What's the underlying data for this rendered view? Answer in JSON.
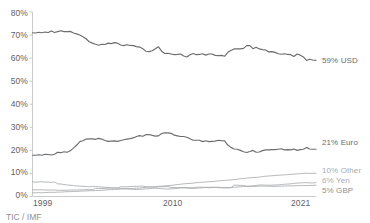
{
  "chart_data": {
    "type": "line",
    "title": "",
    "subtitle": "",
    "xlabel": "",
    "ylabel": "",
    "ylim": [
      0,
      80
    ],
    "xlim": [
      1999,
      2021.75
    ],
    "grid": false,
    "legend_position": "right-of-plot-line-end",
    "y_ticks": [
      "0%",
      "10%",
      "20%",
      "30%",
      "40%",
      "50%",
      "60%",
      "70%",
      "80%"
    ],
    "y_tick_values": [
      0,
      10,
      20,
      30,
      40,
      50,
      60,
      70,
      80
    ],
    "x_ticks": [
      "1999",
      "2010",
      "2021"
    ],
    "x_tick_values": [
      1999,
      2010,
      2021
    ],
    "x": [
      1999,
      1999.25,
      1999.5,
      1999.75,
      2000,
      2000.25,
      2000.5,
      2000.75,
      2001,
      2001.25,
      2001.5,
      2001.75,
      2002,
      2002.25,
      2002.5,
      2002.75,
      2003,
      2003.25,
      2003.5,
      2003.75,
      2004,
      2004.25,
      2004.5,
      2004.75,
      2005,
      2005.25,
      2005.5,
      2005.75,
      2006,
      2006.25,
      2006.5,
      2006.75,
      2007,
      2007.25,
      2007.5,
      2007.75,
      2008,
      2008.25,
      2008.5,
      2008.75,
      2009,
      2009.25,
      2009.5,
      2009.75,
      2010,
      2010.25,
      2010.5,
      2010.75,
      2011,
      2011.25,
      2011.5,
      2011.75,
      2012,
      2012.25,
      2012.5,
      2012.75,
      2013,
      2013.25,
      2013.5,
      2013.75,
      2014,
      2014.25,
      2014.5,
      2014.75,
      2015,
      2015.25,
      2015.5,
      2015.75,
      2016,
      2016.25,
      2016.5,
      2016.75,
      2017,
      2017.25,
      2017.5,
      2017.75,
      2018,
      2018.25,
      2018.5,
      2018.75,
      2019,
      2019.25,
      2019.5,
      2019.75,
      2020,
      2020.25,
      2020.5,
      2020.75,
      2021,
      2021.25,
      2021.5
    ],
    "series": [
      {
        "name": "USD",
        "end_label": "59% USD",
        "end_value": 59,
        "color": "#6b6d6f",
        "emphasis": "strong",
        "values": [
          71.0,
          70.9,
          71.2,
          71.0,
          71.3,
          71.1,
          71.8,
          71.1,
          71.5,
          71.9,
          71.5,
          71.5,
          71.6,
          70.9,
          70.5,
          70.0,
          69.3,
          68.4,
          67.1,
          66.5,
          66.0,
          65.6,
          66.0,
          65.9,
          66.5,
          66.3,
          66.7,
          66.5,
          65.7,
          65.4,
          65.8,
          65.5,
          65.4,
          65.0,
          64.8,
          64.1,
          63.0,
          62.8,
          63.2,
          64.1,
          64.9,
          63.0,
          62.0,
          62.1,
          61.8,
          61.5,
          61.6,
          61.8,
          60.9,
          60.5,
          61.5,
          62.0,
          61.5,
          61.6,
          61.9,
          61.3,
          61.8,
          61.8,
          61.2,
          61.1,
          61.2,
          60.8,
          62.5,
          63.3,
          64.0,
          64.0,
          64.0,
          64.2,
          65.4,
          65.4,
          64.1,
          64.7,
          64.0,
          63.7,
          63.5,
          62.7,
          62.8,
          62.5,
          61.9,
          61.7,
          61.9,
          61.6,
          61.5,
          60.7,
          61.8,
          61.3,
          60.5,
          59.0,
          59.5,
          59.2,
          59.0
        ]
      },
      {
        "name": "Euro",
        "end_label": "21% Euro",
        "end_value": 21,
        "color": "#6b6d6f",
        "emphasis": "strong",
        "values": [
          17.9,
          17.9,
          18.1,
          17.9,
          18.3,
          18.2,
          18.0,
          18.3,
          19.2,
          19.0,
          19.4,
          19.2,
          19.8,
          21.0,
          22.2,
          23.8,
          24.2,
          24.9,
          25.0,
          25.0,
          24.8,
          25.2,
          24.9,
          24.3,
          23.9,
          24.0,
          24.1,
          23.9,
          24.3,
          24.6,
          24.9,
          25.1,
          25.4,
          26.0,
          26.4,
          26.1,
          26.8,
          26.9,
          26.5,
          26.2,
          26.3,
          27.3,
          27.6,
          27.6,
          27.4,
          26.6,
          26.3,
          26.0,
          26.0,
          25.7,
          25.0,
          24.4,
          24.4,
          24.4,
          23.8,
          24.2,
          23.8,
          23.9,
          24.0,
          24.4,
          24.2,
          24.1,
          22.3,
          21.3,
          20.6,
          20.5,
          20.0,
          19.4,
          19.1,
          19.5,
          20.0,
          19.2,
          19.3,
          19.9,
          20.2,
          20.2,
          20.3,
          20.3,
          20.5,
          20.7,
          20.2,
          20.3,
          20.2,
          20.6,
          20.0,
          20.3,
          20.5,
          21.3,
          20.6,
          20.5,
          20.5
        ]
      },
      {
        "name": "Other",
        "end_label": "10% Other",
        "end_value": 10,
        "color": "#a9abad",
        "emphasis": "faint",
        "values": [
          1.6,
          1.6,
          1.7,
          1.6,
          1.7,
          1.8,
          1.8,
          1.8,
          1.9,
          1.9,
          2.0,
          2.1,
          2.1,
          2.2,
          2.2,
          2.3,
          2.4,
          2.4,
          2.5,
          2.5,
          2.6,
          2.6,
          2.7,
          2.8,
          2.9,
          3.0,
          3.0,
          3.1,
          3.2,
          3.3,
          3.4,
          3.4,
          3.5,
          3.6,
          3.7,
          3.8,
          4.0,
          4.1,
          4.2,
          4.3,
          4.4,
          4.5,
          4.6,
          4.7,
          4.8,
          5.0,
          5.2,
          5.3,
          5.5,
          5.6,
          5.7,
          5.8,
          6.0,
          6.1,
          6.2,
          6.3,
          6.4,
          6.5,
          6.6,
          6.8,
          6.9,
          7.0,
          7.1,
          7.2,
          7.3,
          7.5,
          7.7,
          7.8,
          8.0,
          8.1,
          8.2,
          8.3,
          8.4,
          8.6,
          8.8,
          8.9,
          9.0,
          9.1,
          9.2,
          9.3,
          9.4,
          9.5,
          9.6,
          9.7,
          9.8,
          9.9,
          10.0,
          10.1,
          10.0,
          10.1,
          10.0
        ]
      },
      {
        "name": "Yen",
        "end_label": "6% Yen",
        "end_value": 6,
        "color": "#a9abad",
        "emphasis": "faint",
        "values": [
          6.4,
          6.2,
          6.3,
          6.4,
          6.2,
          6.3,
          6.1,
          6.3,
          5.5,
          5.4,
          5.2,
          5.0,
          4.9,
          4.7,
          4.6,
          4.5,
          4.4,
          4.3,
          4.2,
          4.4,
          4.3,
          4.2,
          4.1,
          4.0,
          3.9,
          3.8,
          3.7,
          3.6,
          3.5,
          3.4,
          3.3,
          3.2,
          3.1,
          3.0,
          3.1,
          3.2,
          3.3,
          3.4,
          3.5,
          3.6,
          3.5,
          3.4,
          3.3,
          3.2,
          3.3,
          3.4,
          3.5,
          3.7,
          3.8,
          3.7,
          3.6,
          3.5,
          3.6,
          3.7,
          3.8,
          3.9,
          3.8,
          3.9,
          3.9,
          3.8,
          3.8,
          3.7,
          3.8,
          3.9,
          4.0,
          4.1,
          4.2,
          4.3,
          4.4,
          4.5,
          4.6,
          4.8,
          5.0,
          5.0,
          4.9,
          4.9,
          4.9,
          5.0,
          5.0,
          5.2,
          5.3,
          5.4,
          5.5,
          5.7,
          5.8,
          5.9,
          6.0,
          6.0,
          5.9,
          5.9,
          6.0
        ]
      },
      {
        "name": "GBP",
        "end_label": "5% GBP",
        "end_value": 5,
        "color": "#a9abad",
        "emphasis": "faint",
        "values": [
          2.9,
          2.9,
          2.9,
          2.9,
          2.8,
          2.8,
          2.8,
          2.8,
          2.7,
          2.7,
          2.7,
          2.7,
          2.8,
          2.8,
          2.8,
          2.9,
          2.9,
          3.0,
          3.0,
          3.0,
          3.5,
          3.5,
          3.5,
          3.5,
          3.6,
          3.6,
          3.7,
          3.7,
          4.2,
          4.2,
          4.2,
          4.3,
          4.4,
          4.4,
          4.5,
          4.5,
          4.2,
          4.2,
          4.1,
          4.0,
          4.2,
          4.2,
          4.3,
          4.3,
          3.9,
          3.9,
          3.9,
          3.9,
          3.8,
          3.8,
          3.8,
          3.8,
          4.0,
          4.0,
          4.0,
          4.0,
          4.0,
          4.0,
          4.0,
          4.0,
          3.9,
          3.9,
          3.8,
          3.8,
          4.9,
          4.9,
          4.8,
          4.8,
          4.4,
          4.4,
          4.4,
          4.4,
          4.5,
          4.5,
          4.5,
          4.5,
          4.4,
          4.4,
          4.5,
          4.5,
          4.5,
          4.6,
          4.6,
          4.6,
          4.7,
          4.7,
          4.8,
          4.7,
          4.8,
          4.8,
          4.9
        ]
      }
    ]
  },
  "axis": {
    "y_labels": [
      "80%",
      "70%",
      "60%",
      "50%",
      "40%",
      "30%",
      "20%",
      "10%",
      "0%"
    ],
    "x_labels": [
      "1999",
      "2010",
      "2021"
    ]
  },
  "labels": {
    "usd": "59% USD",
    "euro": "21% Euro",
    "other": "10% Other",
    "yen": "6% Yen",
    "gbp": "5% GBP"
  },
  "source": {
    "text": "TIC / IMF"
  }
}
